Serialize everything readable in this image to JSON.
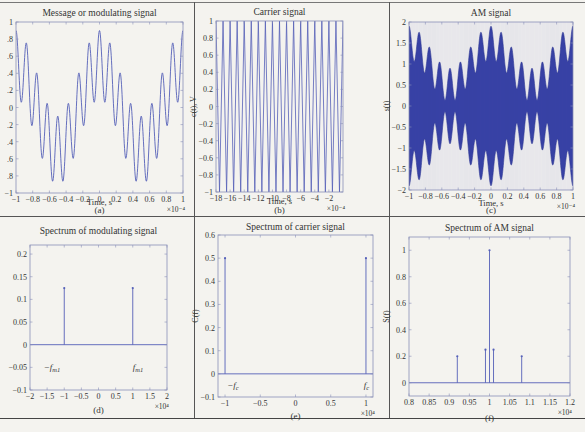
{
  "figure": {
    "background": "#f4f3ef",
    "line_color": "#5560b8",
    "fill_color": "#3a44a8"
  },
  "chart_data": [
    {
      "id": "a",
      "type": "line",
      "title": "Message or modulating signal",
      "xlabel": "Time, s",
      "ylabel": "",
      "x_multiplier": "×10⁻⁴",
      "caption": "(a)",
      "xlim": [
        -1,
        1
      ],
      "ylim": [
        -1,
        1
      ],
      "xticks": [
        -1,
        -0.8,
        -0.6,
        -0.4,
        -0.2,
        0,
        0.2,
        0.4,
        0.6,
        0.8,
        1
      ],
      "xtick_labels": [
        "−1",
        "−0.8",
        "−0.6",
        "−0.4",
        "−0.2",
        "0",
        "0.2",
        "0.4",
        "0.6",
        "0.8",
        "1"
      ],
      "yticks": [
        -1,
        -0.8,
        -0.6,
        -0.4,
        -0.2,
        0,
        0.2,
        0.4,
        0.6,
        0.8,
        1
      ],
      "ytick_labels": [
        "−1",
        ".8",
        ".6",
        ".4",
        ".2",
        "0",
        ".2",
        ".4",
        ".6",
        ".8",
        "1"
      ],
      "signal": "0.5*cos(2π·1e4·t)+0.4*cos(2π·8e4·t)",
      "peaks_y": [
        0.9,
        0.75,
        0.4,
        0.05,
        -0.1,
        0.05,
        0.4,
        0.75,
        0.9
      ],
      "troughs_y": [
        0.05,
        -0.2,
        -0.6,
        -0.85,
        -0.85,
        -0.6,
        -0.2,
        0.05
      ]
    },
    {
      "id": "b",
      "type": "line",
      "title": "Carrier signal",
      "xlabel": "Time, s",
      "ylabel": "c(t), V",
      "x_multiplier": "×10⁻⁴",
      "caption": "(b)",
      "xlim": [
        -18,
        0
      ],
      "ylim": [
        -1,
        1
      ],
      "xticks": [
        -18,
        -16,
        -14,
        -12,
        -10,
        -8,
        -6,
        -4,
        -2
      ],
      "xtick_labels": [
        "−18",
        "−16",
        "−14",
        "−12",
        "−10",
        "−8",
        "−6",
        "−4",
        "−2"
      ],
      "yticks": [
        -1,
        -0.8,
        -0.6,
        -0.4,
        -0.2,
        0,
        0.2,
        0.4,
        0.6,
        0.8,
        1
      ],
      "ytick_labels": [
        "−1",
        "−0.8",
        "−0.6",
        "−0.4",
        "−0.2",
        "0",
        "0.2",
        "0.4",
        "0.6",
        "0.8",
        "1"
      ],
      "cycles": 18
    },
    {
      "id": "c",
      "type": "line",
      "title": "AM signal",
      "xlabel": "Time, s",
      "ylabel": "s(t)",
      "x_multiplier": "×10⁻⁴",
      "caption": "(c)",
      "xlim": [
        -1,
        1
      ],
      "ylim": [
        -2,
        2
      ],
      "xticks": [
        -1,
        -0.8,
        -0.6,
        -0.4,
        -0.2,
        0,
        0.2,
        0.4,
        0.6,
        0.8,
        1
      ],
      "xtick_labels": [
        "−1",
        "−0.8",
        "−0.6",
        "−0.4",
        "−0.2",
        "0",
        "0.2",
        "0.4",
        "0.6",
        "0.8",
        "1"
      ],
      "yticks": [
        -2,
        -1.5,
        -1,
        -0.5,
        0,
        0.5,
        1,
        1.5,
        2
      ],
      "ytick_labels": [
        "−2",
        "−1.5",
        "−1",
        "−0.5",
        "0",
        "0.5",
        "1",
        "1.5",
        "2"
      ],
      "envelope": "1 + message(t)"
    },
    {
      "id": "d",
      "type": "stem",
      "title": "Spectrum of modulating signal",
      "xlabel": "",
      "ylabel": "",
      "x_multiplier": "×10⁴",
      "caption": "(d)",
      "xlim": [
        -2,
        2
      ],
      "ylim": [
        -0.1,
        0.22
      ],
      "xticks": [
        -2,
        -1.5,
        -1,
        -0.5,
        0,
        0.5,
        1,
        1.5,
        2
      ],
      "xtick_labels": [
        "−2",
        "−1.5",
        "−1",
        "−0.5",
        "0",
        "0.5",
        "1",
        "1.5",
        "2"
      ],
      "yticks": [
        -0.1,
        -0.05,
        0,
        0.05,
        0.1,
        0.15,
        0.2
      ],
      "ytick_labels": [
        "−0.1",
        "−0.05",
        "0",
        "0.05",
        "0.1",
        "0.15",
        "0.2"
      ],
      "x": [
        -1,
        1
      ],
      "values": [
        0.125,
        0.125
      ],
      "annotations": [
        {
          "text": "−f",
          "sub": "m1",
          "x": -1.6,
          "y": -0.05
        },
        {
          "text": "f",
          "sub": "m1",
          "x": 1.0,
          "y": -0.05
        }
      ]
    },
    {
      "id": "e",
      "type": "stem",
      "title": "Spectrum of carrier signal",
      "xlabel": "",
      "ylabel": "C(f)",
      "x_multiplier": "×10⁴",
      "caption": "(e)",
      "xlim": [
        -1.1,
        1.1
      ],
      "ylim": [
        -0.1,
        0.6
      ],
      "xticks": [
        -1,
        -0.5,
        0,
        0.5,
        1
      ],
      "xtick_labels": [
        "−1",
        "−0.5",
        "0",
        "0.5",
        "1"
      ],
      "yticks": [
        -0.1,
        0,
        0.1,
        0.2,
        0.3,
        0.4,
        0.5,
        0.6
      ],
      "ytick_labels": [
        "−0.1",
        "0",
        "0.1",
        "0.2",
        "0.3",
        "0.4",
        "0.5",
        "0.6"
      ],
      "x": [
        -1,
        1
      ],
      "values": [
        0.5,
        0.5
      ],
      "annotations": [
        {
          "text": "−f",
          "sub": "c",
          "x": -0.97,
          "y": -0.05
        },
        {
          "text": "f",
          "sub": "c",
          "x": 0.97,
          "y": -0.05
        }
      ]
    },
    {
      "id": "f",
      "type": "stem",
      "title": "Spectrum of AM signal",
      "xlabel": "",
      "ylabel": "S(f)",
      "x_multiplier": "×10⁴",
      "caption": "(f)",
      "xlim": [
        0.8,
        1.2
      ],
      "ylim": [
        -0.1,
        1.1
      ],
      "xticks": [
        0.8,
        0.85,
        0.9,
        0.95,
        1,
        1.05,
        1.1,
        1.15,
        1.2
      ],
      "xtick_labels": [
        "0.8",
        "0.85",
        "0.9",
        "0.95",
        "1",
        "1.05",
        "1.1",
        "1.15",
        "1.2"
      ],
      "yticks": [
        0,
        0.2,
        0.4,
        0.6,
        0.8,
        1
      ],
      "ytick_labels": [
        "0",
        "0.2",
        "0.4",
        "0.6",
        "0.8",
        "1"
      ],
      "x": [
        0.92,
        0.99,
        1.0,
        1.01,
        1.08
      ],
      "values": [
        0.2,
        0.25,
        1.0,
        0.25,
        0.2
      ]
    }
  ]
}
